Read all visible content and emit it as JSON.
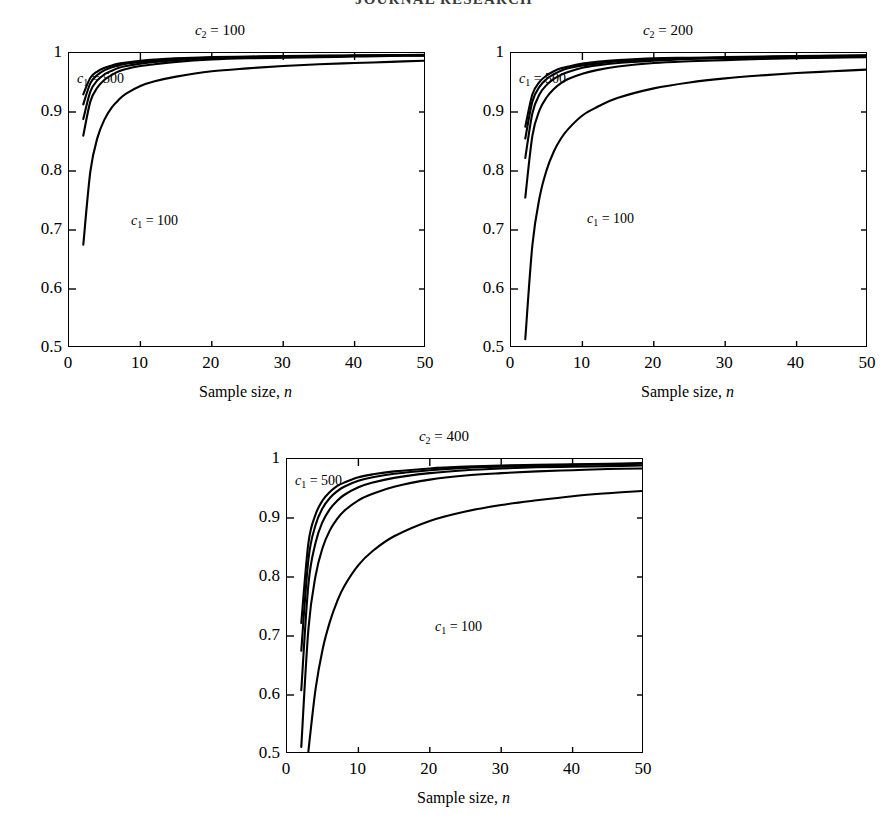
{
  "header": {
    "running_title": "JOURNAL RESEARCH"
  },
  "figure": {
    "xlabel": "Sample size, n",
    "xlabel_var": "n",
    "xlabel_text": "Sample size,",
    "ann_high_prefix": "c",
    "ann_high_sub": "1",
    "ann_high_eq": "= 500",
    "ann_low_prefix": "c",
    "ann_low_sub": "1",
    "ann_low_eq": "= 100"
  },
  "panels": [
    {
      "id": "panel-c2-100",
      "title_prefix": "c",
      "title_sub": "2",
      "title_eq": "= 100",
      "title": "c2 = 100",
      "label_high": "c1 = 500",
      "label_low": "c1 = 100"
    },
    {
      "id": "panel-c2-200",
      "title_prefix": "c",
      "title_sub": "2",
      "title_eq": "= 200",
      "title": "c2 = 200",
      "label_high": "c1 = 500",
      "label_low": "c1 = 100"
    },
    {
      "id": "panel-c2-400",
      "title_prefix": "c",
      "title_sub": "2",
      "title_eq": "= 400",
      "title": "c2 = 400",
      "label_high": "c1 = 500",
      "label_low": "c1 = 100"
    }
  ],
  "axes": {
    "xticks": [
      "0",
      "10",
      "20",
      "30",
      "40",
      "50"
    ],
    "xtick_values": [
      0,
      10,
      20,
      30,
      40,
      50
    ],
    "yticks": [
      "0.5",
      "0.6",
      "0.7",
      "0.8",
      "0.9",
      "1"
    ],
    "ytick_values": [
      0.5,
      0.6,
      0.7,
      0.8,
      0.9,
      1.0
    ],
    "xlim": [
      0,
      50
    ],
    "ylim": [
      0.5,
      1.0
    ]
  },
  "chart_data": [
    {
      "type": "line",
      "title": "c2 = 100",
      "xlabel": "Sample size, n",
      "ylabel": "",
      "xlim": [
        0,
        50
      ],
      "ylim": [
        0.5,
        1.0
      ],
      "grid": false,
      "legend": "inline-annotations",
      "annotations": [
        "c1 = 500",
        "c1 = 100"
      ],
      "x": [
        2,
        3,
        4,
        5,
        6,
        7,
        8,
        10,
        12,
        15,
        20,
        25,
        30,
        35,
        40,
        45,
        50
      ],
      "series": [
        {
          "name": "c1 = 500",
          "values": [
            0.93,
            0.958,
            0.969,
            0.975,
            0.979,
            0.982,
            0.984,
            0.987,
            0.989,
            0.991,
            0.993,
            0.994,
            0.995,
            0.9955,
            0.996,
            0.9965,
            0.997
          ]
        },
        {
          "name": "c1 = 400",
          "values": [
            0.913,
            0.949,
            0.963,
            0.971,
            0.976,
            0.979,
            0.982,
            0.985,
            0.987,
            0.99,
            0.992,
            0.993,
            0.994,
            0.995,
            0.9955,
            0.996,
            0.9965
          ]
        },
        {
          "name": "c1 = 300",
          "values": [
            0.888,
            0.935,
            0.954,
            0.964,
            0.97,
            0.975,
            0.978,
            0.982,
            0.985,
            0.988,
            0.991,
            0.992,
            0.993,
            0.994,
            0.995,
            0.9955,
            0.996
          ]
        },
        {
          "name": "c1 = 200",
          "values": [
            0.86,
            0.918,
            0.942,
            0.955,
            0.963,
            0.969,
            0.973,
            0.978,
            0.981,
            0.985,
            0.989,
            0.991,
            0.992,
            0.993,
            0.994,
            0.995,
            0.9955
          ]
        },
        {
          "name": "c1 = 100",
          "values": [
            0.675,
            0.8,
            0.857,
            0.888,
            0.908,
            0.921,
            0.931,
            0.944,
            0.952,
            0.96,
            0.969,
            0.974,
            0.978,
            0.981,
            0.983,
            0.985,
            0.987
          ]
        }
      ]
    },
    {
      "type": "line",
      "title": "c2 = 200",
      "xlabel": "Sample size, n",
      "ylabel": "",
      "xlim": [
        0,
        50
      ],
      "ylim": [
        0.5,
        1.0
      ],
      "grid": false,
      "legend": "inline-annotations",
      "annotations": [
        "c1 = 500",
        "c1 = 100"
      ],
      "x": [
        2,
        3,
        4,
        5,
        6,
        7,
        8,
        10,
        12,
        15,
        20,
        25,
        30,
        35,
        40,
        45,
        50
      ],
      "series": [
        {
          "name": "c1 = 500",
          "values": [
            0.875,
            0.93,
            0.951,
            0.962,
            0.969,
            0.974,
            0.977,
            0.982,
            0.985,
            0.988,
            0.991,
            0.992,
            0.993,
            0.994,
            0.995,
            0.9955,
            0.996
          ]
        },
        {
          "name": "c1 = 400",
          "values": [
            0.855,
            0.918,
            0.943,
            0.956,
            0.964,
            0.97,
            0.974,
            0.979,
            0.982,
            0.986,
            0.989,
            0.991,
            0.992,
            0.993,
            0.994,
            0.995,
            0.9955
          ]
        },
        {
          "name": "c1 = 300",
          "values": [
            0.822,
            0.898,
            0.93,
            0.946,
            0.956,
            0.963,
            0.968,
            0.975,
            0.979,
            0.983,
            0.987,
            0.99,
            0.991,
            0.992,
            0.993,
            0.994,
            0.995
          ]
        },
        {
          "name": "c1 = 200",
          "values": [
            0.755,
            0.86,
            0.903,
            0.925,
            0.939,
            0.949,
            0.956,
            0.965,
            0.971,
            0.977,
            0.983,
            0.986,
            0.988,
            0.99,
            0.991,
            0.992,
            0.993
          ]
        },
        {
          "name": "c1 = 100",
          "values": [
            0.515,
            0.675,
            0.755,
            0.802,
            0.833,
            0.855,
            0.871,
            0.894,
            0.908,
            0.924,
            0.94,
            0.95,
            0.957,
            0.962,
            0.966,
            0.969,
            0.972
          ]
        }
      ]
    },
    {
      "type": "line",
      "title": "c2 = 400",
      "xlabel": "Sample size, n",
      "ylabel": "",
      "xlim": [
        0,
        50
      ],
      "ylim": [
        0.5,
        1.0
      ],
      "grid": false,
      "legend": "inline-annotations",
      "annotations": [
        "c1 = 500",
        "c1 = 100"
      ],
      "x": [
        2,
        3,
        4,
        5,
        6,
        7,
        8,
        10,
        12,
        15,
        20,
        25,
        30,
        35,
        40,
        45,
        50
      ],
      "series": [
        {
          "name": "c1 = 500",
          "values": [
            0.722,
            0.858,
            0.906,
            0.93,
            0.944,
            0.954,
            0.96,
            0.969,
            0.974,
            0.979,
            0.984,
            0.987,
            0.989,
            0.99,
            0.991,
            0.992,
            0.993
          ]
        },
        {
          "name": "c1 = 400",
          "values": [
            0.675,
            0.83,
            0.888,
            0.917,
            0.934,
            0.945,
            0.953,
            0.963,
            0.969,
            0.975,
            0.981,
            0.985,
            0.987,
            0.988,
            0.99,
            0.991,
            0.992
          ]
        },
        {
          "name": "c1 = 300",
          "values": [
            0.608,
            0.788,
            0.858,
            0.894,
            0.915,
            0.929,
            0.939,
            0.952,
            0.96,
            0.968,
            0.976,
            0.981,
            0.984,
            0.986,
            0.987,
            0.988,
            0.989
          ]
        },
        {
          "name": "c1 = 200",
          "values": [
            0.512,
            0.712,
            0.802,
            0.85,
            0.879,
            0.898,
            0.912,
            0.93,
            0.941,
            0.953,
            0.965,
            0.972,
            0.976,
            0.979,
            0.981,
            0.983,
            0.984
          ]
        },
        {
          "name": "c1 = 100",
          "values": [
            0.33,
            0.505,
            0.61,
            0.678,
            0.724,
            0.758,
            0.784,
            0.82,
            0.844,
            0.869,
            0.895,
            0.911,
            0.922,
            0.93,
            0.937,
            0.942,
            0.946
          ]
        }
      ]
    }
  ]
}
